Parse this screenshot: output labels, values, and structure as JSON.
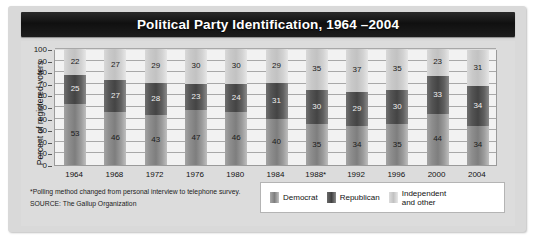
{
  "header": {
    "title": "Political Party Identification, 1964 –2004"
  },
  "footnotes": {
    "polling_note": "*Polling method changed from personal interview to telephone survey.",
    "source": "SOURCE: The Gallup Organization"
  },
  "legend": {
    "items": [
      {
        "label": "Democrat",
        "color": "#7e7e7e",
        "icon": "legend-swatch-democrat"
      },
      {
        "label": "Republican",
        "color": "#414141",
        "icon": "legend-swatch-republican"
      },
      {
        "label": "Independent and other",
        "color": "#c2c2c2",
        "icon": "legend-swatch-independent"
      }
    ]
  },
  "chart_data": {
    "type": "bar",
    "stacked": true,
    "title": "Political Party Identification, 1964 –2004",
    "xlabel": "",
    "ylabel": "Percent of registered voters",
    "ylim": [
      0,
      100
    ],
    "yticks": [
      0,
      10,
      20,
      30,
      40,
      50,
      60,
      70,
      80,
      90,
      100
    ],
    "ytick_labels": [
      "0",
      "10",
      "20",
      "30",
      "40",
      "50",
      "60",
      "70",
      "80",
      "90",
      "100"
    ],
    "grid": true,
    "legend_position": "bottom-right",
    "categories": [
      "1964",
      "1968",
      "1972",
      "1976",
      "1980",
      "1984",
      "1988*",
      "1992",
      "1996",
      "2000",
      "2004"
    ],
    "series": [
      {
        "name": "Democrat",
        "values": [
          53,
          46,
          43,
          47,
          46,
          40,
          35,
          34,
          35,
          44,
          34
        ]
      },
      {
        "name": "Republican",
        "values": [
          25,
          27,
          28,
          23,
          24,
          31,
          30,
          29,
          30,
          33,
          34
        ]
      },
      {
        "name": "Independent and other",
        "values": [
          22,
          27,
          29,
          30,
          30,
          29,
          35,
          37,
          35,
          23,
          31
        ]
      }
    ],
    "annotations": [
      "*Polling method changed from personal interview to telephone survey.",
      "SOURCE: The Gallup Organization"
    ]
  }
}
